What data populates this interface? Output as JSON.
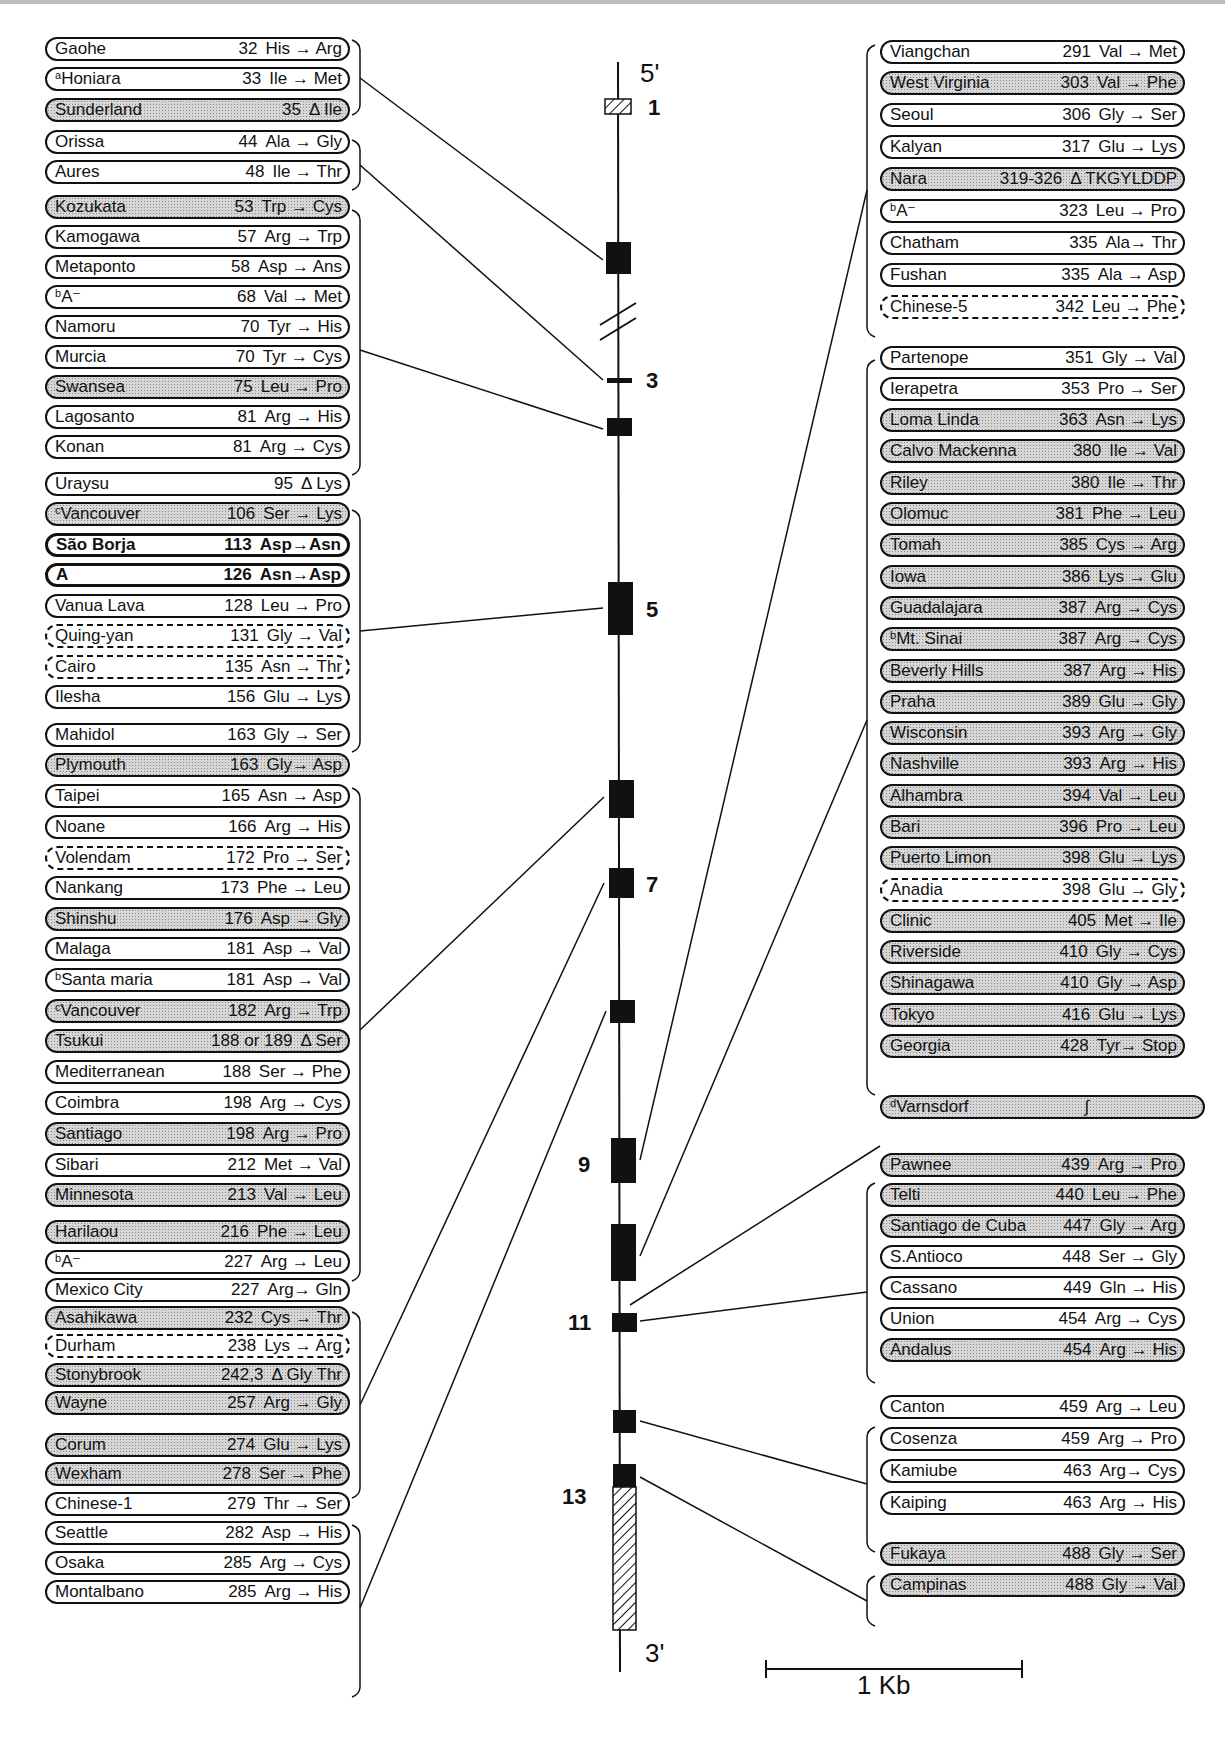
{
  "figure": {
    "five_prime_label": "5'",
    "three_prime_label": "3'",
    "scale_bar_label": "1 Kb",
    "exon_labels": [
      "1",
      "3",
      "5",
      "7",
      "9",
      "11",
      "13"
    ],
    "colors": {
      "line": "#111111",
      "shaded_fill": "#d6d6d6",
      "exon_fill": "#111111"
    }
  },
  "left_groups": [
    {
      "exon": "2",
      "variants": [
        {
          "name": "Gaohe",
          "sup": "",
          "pos": "32",
          "change": "His → Arg",
          "style": "plain"
        },
        {
          "name": "Honiara",
          "sup": "a",
          "pos": "33",
          "change": "Ile → Met",
          "style": "plain"
        },
        {
          "name": "Sunderland",
          "sup": "",
          "pos": "35",
          "change": "Δ Ile",
          "style": "shaded"
        }
      ]
    },
    {
      "exon": "3",
      "variants": [
        {
          "name": "Orissa",
          "sup": "",
          "pos": "44",
          "change": "Ala → Gly",
          "style": "plain"
        },
        {
          "name": "Aures",
          "sup": "",
          "pos": "48",
          "change": "Ile → Thr",
          "style": "plain"
        }
      ]
    },
    {
      "exon": "4",
      "variants": [
        {
          "name": "Kozukata",
          "sup": "",
          "pos": "53",
          "change": "Trp → Cys",
          "style": "shaded"
        },
        {
          "name": "Kamogawa",
          "sup": "",
          "pos": "57",
          "change": "Arg → Trp",
          "style": "plain"
        },
        {
          "name": "Metaponto",
          "sup": "",
          "pos": "58",
          "change": "Asp → Ans",
          "style": "plain"
        },
        {
          "name": "A⁻",
          "sup": "b",
          "pos": "68",
          "change": "Val → Met",
          "style": "plain"
        },
        {
          "name": "Namoru",
          "sup": "",
          "pos": "70",
          "change": "Tyr → His",
          "style": "plain"
        },
        {
          "name": "Murcia",
          "sup": "",
          "pos": "70",
          "change": "Tyr → Cys",
          "style": "plain"
        },
        {
          "name": "Swansea",
          "sup": "",
          "pos": "75",
          "change": "Leu → Pro",
          "style": "shaded"
        },
        {
          "name": "Lagosanto",
          "sup": "",
          "pos": "81",
          "change": "Arg → His",
          "style": "plain"
        },
        {
          "name": "Konan",
          "sup": "",
          "pos": "81",
          "change": "Arg → Cys",
          "style": "plain"
        }
      ]
    },
    {
      "exon": "5",
      "variants": [
        {
          "name": "Uraysu",
          "sup": "",
          "pos": "95",
          "change": "Δ Lys",
          "style": "plain"
        },
        {
          "name": "Vancouver",
          "sup": "c",
          "pos": "106",
          "change": "Ser → Lys",
          "style": "shaded"
        },
        {
          "name": "São Borja",
          "sup": "",
          "pos": "113",
          "change": "Asp→Asn",
          "style": "bold"
        },
        {
          "name": "A",
          "sup": "",
          "pos": "126",
          "change": "Asn→Asp",
          "style": "bold"
        },
        {
          "name": "Vanua Lava",
          "sup": "",
          "pos": "128",
          "change": "Leu → Pro",
          "style": "plain"
        },
        {
          "name": "Quing-yan",
          "sup": "",
          "pos": "131",
          "change": "Gly → Val",
          "style": "dashed"
        },
        {
          "name": "Cairo",
          "sup": "",
          "pos": "135",
          "change": "Asn → Thr",
          "style": "dashed"
        },
        {
          "name": "Ilesha",
          "sup": "",
          "pos": "156",
          "change": "Glu → Lys",
          "style": "plain"
        }
      ]
    },
    {
      "exon": "6",
      "variants": [
        {
          "name": "Mahidol",
          "sup": "",
          "pos": "163",
          "change": "Gly → Ser",
          "style": "plain"
        },
        {
          "name": "Plymouth",
          "sup": "",
          "pos": "163",
          "change": "Gly→ Asp",
          "style": "shaded"
        },
        {
          "name": "Taipei",
          "sup": "",
          "pos": "165",
          "change": "Asn → Asp",
          "style": "plain"
        },
        {
          "name": "Noane",
          "sup": "",
          "pos": "166",
          "change": "Arg → His",
          "style": "plain"
        },
        {
          "name": "Volendam",
          "sup": "",
          "pos": "172",
          "change": "Pro → Ser",
          "style": "dashed"
        },
        {
          "name": "Nankang",
          "sup": "",
          "pos": "173",
          "change": "Phe → Leu",
          "style": "plain"
        },
        {
          "name": "Shinshu",
          "sup": "",
          "pos": "176",
          "change": "Asp → Gly",
          "style": "shaded"
        },
        {
          "name": "Malaga",
          "sup": "",
          "pos": "181",
          "change": "Asp → Val",
          "style": "plain"
        },
        {
          "name": "Santa maria",
          "sup": "b",
          "pos": "181",
          "change": "Asp → Val",
          "style": "plain"
        },
        {
          "name": "Vancouver",
          "sup": "c",
          "pos": "182",
          "change": "Arg → Trp",
          "style": "shaded"
        },
        {
          "name": "Tsukui",
          "sup": "",
          "pos": "188 or 189",
          "change": "Δ Ser",
          "style": "shaded"
        },
        {
          "name": "Mediterranean",
          "sup": "",
          "pos": "188",
          "change": "Ser → Phe",
          "style": "plain"
        },
        {
          "name": "Coimbra",
          "sup": "",
          "pos": "198",
          "change": "Arg → Cys",
          "style": "plain"
        },
        {
          "name": "Santiago",
          "sup": "",
          "pos": "198",
          "change": "Arg → Pro",
          "style": "shaded"
        },
        {
          "name": "Sibari",
          "sup": "",
          "pos": "212",
          "change": "Met → Val",
          "style": "plain"
        },
        {
          "name": "Minnesota",
          "sup": "",
          "pos": "213",
          "change": "Val → Leu",
          "style": "shaded"
        }
      ]
    },
    {
      "exon": "7",
      "variants": [
        {
          "name": "Harilaou",
          "sup": "",
          "pos": "216",
          "change": "Phe → Leu",
          "style": "shaded"
        },
        {
          "name": "A⁻",
          "sup": "b",
          "pos": "227",
          "change": "Arg → Leu",
          "style": "plain"
        },
        {
          "name": "Mexico City",
          "sup": "",
          "pos": "227",
          "change": "Arg→ Gln",
          "style": "plain"
        },
        {
          "name": "Asahikawa",
          "sup": "",
          "pos": "232",
          "change": "Cys → Thr",
          "style": "shaded"
        },
        {
          "name": "Durham",
          "sup": "",
          "pos": "238",
          "change": "Lys → Arg",
          "style": "dashed"
        },
        {
          "name": "Stonybrook",
          "sup": "",
          "pos": "242,3",
          "change": "Δ Gly Thr",
          "style": "shaded"
        },
        {
          "name": "Wayne",
          "sup": "",
          "pos": "257",
          "change": "Arg → Gly",
          "style": "shaded"
        }
      ]
    },
    {
      "exon": "8",
      "variants": [
        {
          "name": "Corum",
          "sup": "",
          "pos": "274",
          "change": "Glu → Lys",
          "style": "shaded"
        },
        {
          "name": "Wexham",
          "sup": "",
          "pos": "278",
          "change": "Ser → Phe",
          "style": "shaded"
        },
        {
          "name": "Chinese-1",
          "sup": "",
          "pos": "279",
          "change": "Thr → Ser",
          "style": "plain"
        },
        {
          "name": "Seattle",
          "sup": "",
          "pos": "282",
          "change": "Asp → His",
          "style": "plain"
        },
        {
          "name": "Osaka",
          "sup": "",
          "pos": "285",
          "change": "Arg → Cys",
          "style": "plain"
        },
        {
          "name": "Montalbano",
          "sup": "",
          "pos": "285",
          "change": "Arg → His",
          "style": "plain"
        }
      ]
    }
  ],
  "right_groups": [
    {
      "exon": "9",
      "variants": [
        {
          "name": "Viangchan",
          "sup": "",
          "pos": "291",
          "change": "Val → Met",
          "style": "plain"
        },
        {
          "name": "West Virginia",
          "sup": "",
          "pos": "303",
          "change": "Val → Phe",
          "style": "shaded"
        },
        {
          "name": "Seoul",
          "sup": "",
          "pos": "306",
          "change": "Gly → Ser",
          "style": "plain"
        },
        {
          "name": "Kalyan",
          "sup": "",
          "pos": "317",
          "change": "Glu → Lys",
          "style": "plain"
        },
        {
          "name": "Nara",
          "sup": "",
          "pos": "319-326",
          "change": "Δ TKGYLDDP",
          "style": "shaded"
        },
        {
          "name": "A⁻",
          "sup": "b",
          "pos": "323",
          "change": "Leu → Pro",
          "style": "plain"
        },
        {
          "name": "Chatham",
          "sup": "",
          "pos": "335",
          "change": "Ala→ Thr",
          "style": "plain"
        },
        {
          "name": "Fushan",
          "sup": "",
          "pos": "335",
          "change": "Ala → Asp",
          "style": "plain"
        },
        {
          "name": "Chinese-5",
          "sup": "",
          "pos": "342",
          "change": "Leu → Phe",
          "style": "dashed"
        }
      ]
    },
    {
      "exon": "10",
      "variants": [
        {
          "name": "Partenope",
          "sup": "",
          "pos": "351",
          "change": "Gly → Val",
          "style": "plain"
        },
        {
          "name": "Ierapetra",
          "sup": "",
          "pos": "353",
          "change": "Pro → Ser",
          "style": "plain"
        },
        {
          "name": "Loma Linda",
          "sup": "",
          "pos": "363",
          "change": "Asn → Lys",
          "style": "shaded"
        },
        {
          "name": "Calvo Mackenna",
          "sup": "",
          "pos": "380",
          "change": "Ile → Val",
          "style": "shaded"
        },
        {
          "name": "Riley",
          "sup": "",
          "pos": "380",
          "change": "Ile → Thr",
          "style": "shaded"
        },
        {
          "name": "Olomuc",
          "sup": "",
          "pos": "381",
          "change": "Phe → Leu",
          "style": "shaded"
        },
        {
          "name": "Tomah",
          "sup": "",
          "pos": "385",
          "change": "Cys → Arg",
          "style": "shaded"
        },
        {
          "name": "Iowa",
          "sup": "",
          "pos": "386",
          "change": "Lys → Glu",
          "style": "shaded"
        },
        {
          "name": "Guadalajara",
          "sup": "",
          "pos": "387",
          "change": "Arg → Cys",
          "style": "shaded"
        },
        {
          "name": "Mt. Sinai",
          "sup": "b",
          "pos": "387",
          "change": "Arg → Cys",
          "style": "shaded"
        },
        {
          "name": "Beverly Hills",
          "sup": "",
          "pos": "387",
          "change": "Arg → His",
          "style": "shaded"
        },
        {
          "name": "Praha",
          "sup": "",
          "pos": "389",
          "change": "Glu → Gly",
          "style": "shaded"
        },
        {
          "name": "Wisconsin",
          "sup": "",
          "pos": "393",
          "change": "Arg → Gly",
          "style": "shaded"
        },
        {
          "name": "Nashville",
          "sup": "",
          "pos": "393",
          "change": "Arg → His",
          "style": "shaded"
        },
        {
          "name": "Alhambra",
          "sup": "",
          "pos": "394",
          "change": "Val → Leu",
          "style": "shaded"
        },
        {
          "name": "Bari",
          "sup": "",
          "pos": "396",
          "change": "Pro → Leu",
          "style": "shaded"
        },
        {
          "name": "Puerto Limon",
          "sup": "",
          "pos": "398",
          "change": "Glu → Lys",
          "style": "shaded"
        },
        {
          "name": "Anadia",
          "sup": "",
          "pos": "398",
          "change": "Glu → Gly",
          "style": "dashed"
        },
        {
          "name": "Clinic",
          "sup": "",
          "pos": "405",
          "change": "Met → Ile",
          "style": "shaded"
        },
        {
          "name": "Riverside",
          "sup": "",
          "pos": "410",
          "change": "Gly → Cys",
          "style": "shaded"
        },
        {
          "name": "Shinagawa",
          "sup": "",
          "pos": "410",
          "change": "Gly → Asp",
          "style": "shaded"
        },
        {
          "name": "Tokyo",
          "sup": "",
          "pos": "416",
          "change": "Glu → Lys",
          "style": "shaded"
        },
        {
          "name": "Georgia",
          "sup": "",
          "pos": "428",
          "change": "Tyr→ Stop",
          "style": "shaded"
        }
      ]
    },
    {
      "exon": "intron-10/11",
      "variants": [
        {
          "name": "Varnsdorf",
          "sup": "d",
          "pos": "",
          "change": "∫",
          "style": "shaded"
        }
      ]
    },
    {
      "exon": "11",
      "variants": [
        {
          "name": "Pawnee",
          "sup": "",
          "pos": "439",
          "change": "Arg → Pro",
          "style": "shaded"
        },
        {
          "name": "Telti",
          "sup": "",
          "pos": "440",
          "change": "Leu → Phe",
          "style": "shaded"
        },
        {
          "name": "Santiago de Cuba",
          "sup": "",
          "pos": "447",
          "change": "Gly → Arg",
          "style": "shaded"
        },
        {
          "name": "S.Antioco",
          "sup": "",
          "pos": "448",
          "change": "Ser → Gly",
          "style": "plain"
        },
        {
          "name": "Cassano",
          "sup": "",
          "pos": "449",
          "change": "Gln → His",
          "style": "plain"
        },
        {
          "name": "Union",
          "sup": "",
          "pos": "454",
          "change": "Arg → Cys",
          "style": "plain"
        },
        {
          "name": "Andalus",
          "sup": "",
          "pos": "454",
          "change": "Arg → His",
          "style": "shaded"
        }
      ]
    },
    {
      "exon": "12",
      "variants": [
        {
          "name": "Canton",
          "sup": "",
          "pos": "459",
          "change": "Arg → Leu",
          "style": "plain"
        },
        {
          "name": "Cosenza",
          "sup": "",
          "pos": "459",
          "change": "Arg → Pro",
          "style": "plain"
        },
        {
          "name": "Kamiube",
          "sup": "",
          "pos": "463",
          "change": "Arg→ Cys",
          "style": "plain"
        },
        {
          "name": "Kaiping",
          "sup": "",
          "pos": "463",
          "change": "Arg → His",
          "style": "plain"
        }
      ]
    },
    {
      "exon": "13",
      "variants": [
        {
          "name": "Fukaya",
          "sup": "",
          "pos": "488",
          "change": "Gly → Ser",
          "style": "shaded"
        },
        {
          "name": "Campinas",
          "sup": "",
          "pos": "488",
          "change": "Gly → Val",
          "style": "shaded"
        }
      ]
    }
  ]
}
